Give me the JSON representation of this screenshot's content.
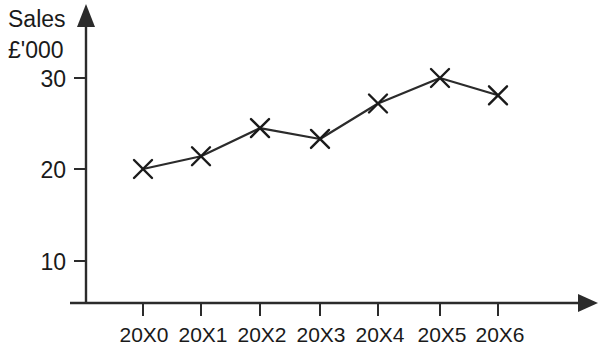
{
  "chart_data": {
    "type": "line",
    "title": "",
    "subtitle": "",
    "ylabel_line1": "Sales",
    "ylabel_line2": "£'000",
    "xlabel": "",
    "categories": [
      "20X0",
      "20X1",
      "20X2",
      "20X3",
      "20X4",
      "20X5",
      "20X6"
    ],
    "values": [
      20.0,
      21.4,
      24.5,
      23.3,
      27.2,
      30.0,
      28.1
    ],
    "series": [
      {
        "name": "Sales",
        "values": [
          20.0,
          21.4,
          24.5,
          23.3,
          27.2,
          30.0,
          28.1
        ]
      }
    ],
    "y_ticks": [
      10,
      20,
      30
    ],
    "y_tick_labels": [
      "10",
      "20",
      "30"
    ],
    "ylim": [
      0,
      33
    ],
    "grid": false,
    "legend": false,
    "legend_position": "none",
    "marker": "x-cross",
    "line_color": "#2b2b2b",
    "marker_color": "#1a1a1a",
    "background_color": "#ffffff",
    "axis_color": "#2b2b2b",
    "y_axis_arrow": true,
    "x_axis_arrow": true,
    "annotations": []
  },
  "geometry": {
    "axis_x": 86,
    "axis_baseline_y": 303,
    "y_value_30": 78,
    "y_value_20": 169,
    "y_value_10": 261,
    "x_positions": [
      143,
      201,
      260,
      320,
      378,
      440,
      498
    ]
  }
}
